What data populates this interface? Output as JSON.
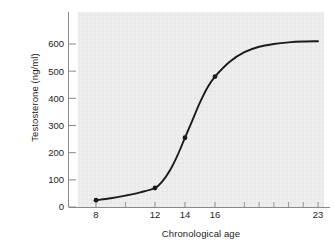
{
  "chart_data": {
    "type": "line",
    "title": "",
    "subtitle": "",
    "xlabel": "Chronological age",
    "ylabel": "Testosterone (ng/ml)",
    "xlim": [
      8,
      23
    ],
    "ylim": [
      0,
      650
    ],
    "grid": false,
    "legend": null,
    "x_tick_labels": [
      "8",
      "12",
      "14",
      "16",
      "23"
    ],
    "x_tick_values": [
      8,
      12,
      14,
      16,
      23
    ],
    "y_tick_labels": [
      "0",
      "100",
      "200",
      "300",
      "400",
      "500",
      "600"
    ],
    "y_tick_values": [
      0,
      100,
      200,
      300,
      400,
      500,
      600
    ],
    "x_minor_tick_values": [
      10,
      18,
      19,
      20,
      21,
      22
    ],
    "axis_note": "x axis spacing is non-linear: ages 8-16 are expanded, 16-23 compressed",
    "series": [
      {
        "name": "Testosterone",
        "marker": "filled-circle",
        "line_color": "#1b1b1b",
        "marker_color": "#1b1b1b",
        "marked_points": [
          {
            "x": 8,
            "y": 25
          },
          {
            "x": 12,
            "y": 70
          },
          {
            "x": 14,
            "y": 255
          },
          {
            "x": 16,
            "y": 480
          }
        ],
        "curve_points": [
          {
            "x": 8,
            "y": 25
          },
          {
            "x": 9,
            "y": 32
          },
          {
            "x": 10,
            "y": 42
          },
          {
            "x": 11,
            "y": 54
          },
          {
            "x": 12,
            "y": 70
          },
          {
            "x": 12.5,
            "y": 95
          },
          {
            "x": 13,
            "y": 135
          },
          {
            "x": 13.5,
            "y": 190
          },
          {
            "x": 14,
            "y": 255
          },
          {
            "x": 14.5,
            "y": 320
          },
          {
            "x": 15,
            "y": 385
          },
          {
            "x": 15.5,
            "y": 440
          },
          {
            "x": 16,
            "y": 480
          },
          {
            "x": 17,
            "y": 535
          },
          {
            "x": 18,
            "y": 570
          },
          {
            "x": 19,
            "y": 590
          },
          {
            "x": 20,
            "y": 600
          },
          {
            "x": 21,
            "y": 606
          },
          {
            "x": 22,
            "y": 609
          },
          {
            "x": 23,
            "y": 610
          }
        ]
      }
    ],
    "colors": {
      "plot_background": "#ececec",
      "figure_background": "#ffffff",
      "axis": "#8a8a8a",
      "curve": "#1b1b1b",
      "text": "#1d1d1d"
    }
  }
}
